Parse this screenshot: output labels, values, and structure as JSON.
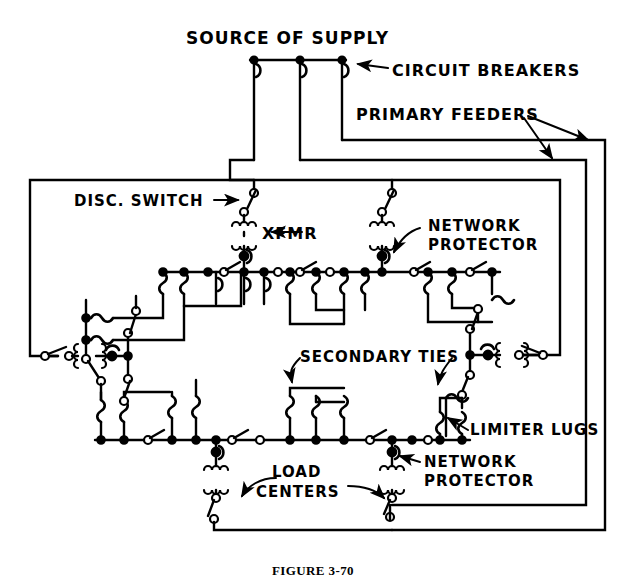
{
  "figure": {
    "caption": "FIGURE 3-70",
    "background_color": "#ffffff",
    "line_color": "#000000"
  },
  "labels": {
    "source_of_supply": "SOURCE OF SUPPLY",
    "circuit_breakers": "CIRCUIT BREAKERS",
    "primary_feeders": "PRIMARY FEEDERS",
    "disc_switch": "DISC. SWITCH",
    "xfmr": "XFMR",
    "network_protector_top_line1": "NETWORK",
    "network_protector_top_line2": "PROTECTOR",
    "secondary_ties": "SECONDARY TIES",
    "limiter_lugs": "LIMITER LUGS",
    "load_centers_line1": "LOAD",
    "load_centers_line2": "CENTERS",
    "network_protector_bottom_line1": "NETWORK",
    "network_protector_bottom_line2": "PROTECTOR"
  },
  "diagram_data": {
    "type": "schematic",
    "domain": "electrical-one-line-diagram",
    "components": [
      {
        "name": "source-bus",
        "count": 1
      },
      {
        "name": "circuit-breaker",
        "count": 3
      },
      {
        "name": "primary-feeder-loop",
        "count": 3
      },
      {
        "name": "disconnect-switch",
        "count": 8
      },
      {
        "name": "network-transformer",
        "count": 6
      },
      {
        "name": "network-protector",
        "count": 6
      },
      {
        "name": "cable-limiter",
        "count": 24
      },
      {
        "name": "secondary-tie-bus",
        "count": 4
      },
      {
        "name": "load-center-transformer",
        "count": 2
      }
    ]
  }
}
